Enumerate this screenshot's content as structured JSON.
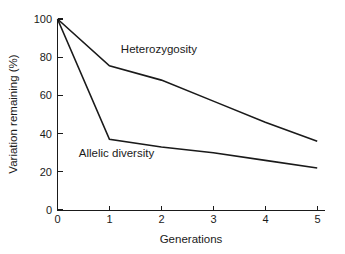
{
  "chart_data": {
    "type": "line",
    "title": "",
    "xlabel": "Generations",
    "ylabel": "Variation remaining (%)",
    "x": [
      0,
      1,
      2,
      3,
      4,
      5
    ],
    "xlim": [
      0,
      5.15
    ],
    "ylim": [
      0,
      100
    ],
    "xticks": [
      "0",
      "1",
      "2",
      "3",
      "4",
      "5"
    ],
    "yticks": [
      "0",
      "20",
      "40",
      "60",
      "80",
      "100"
    ],
    "grid": false,
    "legend_position": "inline-annotation",
    "series": [
      {
        "name": "Heterozygosity",
        "values": [
          100,
          75.5,
          68,
          57,
          46,
          36
        ],
        "color": "#1a1a1a",
        "label_x": 1.22,
        "label_y": 82
      },
      {
        "name": "Allelic diversity",
        "values": [
          100,
          37,
          33,
          30,
          26,
          22
        ],
        "color": "#1a1a1a",
        "label_x": 0.41,
        "label_y": 28
      }
    ]
  },
  "axes": {
    "y_title": "Variation remaining (%)",
    "x_title": "Generations",
    "y_tick_labels": [
      "100",
      "80",
      "60",
      "40",
      "20",
      "0"
    ],
    "x_tick_labels": [
      "0",
      "1",
      "2",
      "3",
      "4",
      "5"
    ]
  },
  "annotations": {
    "heterozygosity_label": "Heterozygosity",
    "allelic_diversity_label": "Allelic diversity"
  },
  "colors": {
    "line": "#1a1a1a",
    "axis": "#1a1a1a",
    "background": "#ffffff"
  }
}
